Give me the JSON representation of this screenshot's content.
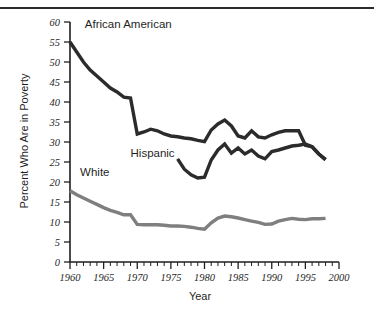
{
  "chart_data": {
    "type": "line",
    "title": "",
    "xlabel": "Year",
    "ylabel": "Percent Who Are in Poverty",
    "xlim": [
      1960,
      2000
    ],
    "ylim": [
      0,
      60
    ],
    "ytick_step": 5,
    "xtick_step": 5,
    "xminor_step": 1,
    "grid": false,
    "legend_position": "inline-annotations",
    "ytick_labels": [
      "0",
      "5",
      "10",
      "15",
      "20",
      "25",
      "30",
      "35",
      "40",
      "45",
      "50",
      "55",
      "60"
    ],
    "xtick_labels": [
      "1960",
      "1965",
      "1970",
      "1975",
      "1980",
      "1985",
      "1990",
      "1995",
      "2000"
    ],
    "series": [
      {
        "name": "African American",
        "label": "African American",
        "color": "#2b2b2b",
        "stroke_width": 3.4,
        "label_x": 1962.2,
        "label_y": 58.4,
        "x": [
          1960,
          1961,
          1962,
          1963,
          1964,
          1965,
          1966,
          1967,
          1968,
          1969,
          1970,
          1971,
          1972,
          1973,
          1974,
          1975,
          1976,
          1977,
          1978,
          1979,
          1980,
          1981,
          1982,
          1983,
          1984,
          1985,
          1986,
          1987,
          1988,
          1989,
          1990,
          1991,
          1992,
          1993,
          1994,
          1995,
          1996,
          1997,
          1998
        ],
        "values": [
          55.0,
          52.5,
          50.0,
          48.0,
          46.5,
          45.0,
          43.5,
          42.5,
          41.2,
          41.0,
          32.0,
          32.5,
          33.2,
          32.8,
          32.0,
          31.5,
          31.3,
          31.0,
          30.8,
          30.4,
          30.1,
          33.0,
          34.5,
          35.5,
          34.0,
          31.5,
          31.0,
          32.8,
          31.3,
          31.0,
          31.8,
          32.4,
          32.8,
          32.8,
          32.8,
          29.2,
          28.8,
          27.0,
          25.6
        ]
      },
      {
        "name": "Hispanic",
        "label": "Hispanic",
        "color": "#2b2b2b",
        "stroke_width": 3.4,
        "label_x": 1969.0,
        "label_y": 26.2,
        "x": [
          1976,
          1977,
          1978,
          1979,
          1980,
          1981,
          1982,
          1983,
          1984,
          1985,
          1986,
          1987,
          1988,
          1989,
          1990,
          1991,
          1992,
          1993,
          1994,
          1995,
          1996,
          1997,
          1998
        ],
        "values": [
          25.8,
          23.2,
          21.8,
          21.0,
          21.2,
          25.5,
          28.0,
          29.5,
          27.2,
          28.5,
          27.0,
          28.0,
          26.5,
          25.8,
          27.6,
          28.0,
          28.5,
          29.0,
          29.2,
          29.5,
          28.8,
          27.0,
          25.6
        ]
      },
      {
        "name": "White",
        "label": "White",
        "color": "#7f7f7f",
        "stroke_width": 3.4,
        "label_x": 1961.5,
        "label_y": 21.5,
        "x": [
          1960,
          1961,
          1962,
          1963,
          1964,
          1965,
          1966,
          1967,
          1968,
          1969,
          1970,
          1971,
          1972,
          1973,
          1974,
          1975,
          1976,
          1977,
          1978,
          1979,
          1980,
          1981,
          1982,
          1983,
          1984,
          1985,
          1986,
          1987,
          1988,
          1989,
          1990,
          1991,
          1992,
          1993,
          1994,
          1995,
          1996,
          1997,
          1998
        ],
        "values": [
          17.8,
          16.8,
          16.0,
          15.2,
          14.4,
          13.6,
          12.9,
          12.4,
          11.8,
          11.8,
          9.4,
          9.3,
          9.3,
          9.3,
          9.2,
          9.0,
          9.0,
          8.9,
          8.7,
          8.4,
          8.2,
          9.8,
          11.0,
          11.5,
          11.3,
          11.0,
          10.6,
          10.2,
          9.9,
          9.4,
          9.5,
          10.2,
          10.6,
          10.9,
          10.7,
          10.6,
          10.8,
          10.8,
          10.9
        ]
      }
    ]
  }
}
